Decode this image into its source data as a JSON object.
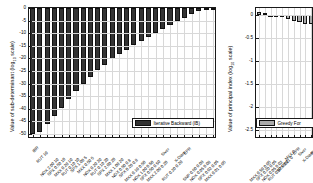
{
  "figure": {
    "background": "#ffffff",
    "axis_color": "#1a1a1a",
    "grid_color": "#d8d8d8"
  },
  "chart_data": [
    {
      "type": "bar",
      "panel": "left",
      "title": "",
      "xlabel": "",
      "ylabel": "Value of sub-determinant (log10 scale)",
      "ylabel_text": "Value of sub-determinant (log",
      "ylabel_sub": "10",
      "ylabel_tail": " scale)",
      "ylim": [
        -52,
        0
      ],
      "yticks": [
        0,
        -5,
        -10,
        -15,
        -20,
        -25,
        -30,
        -35,
        -40,
        -45,
        -50
      ],
      "ytick_labels": [
        "0",
        "-5",
        "-10",
        "-15",
        "-20",
        "-25",
        "-30",
        "-35",
        "-40",
        "-45",
        "-50"
      ],
      "grid": true,
      "bar_color": "#333333",
      "bar_edge_color": "#111111",
      "legend_position": "lower-right",
      "legend": [
        "Iterative Backward (IB)"
      ],
      "categories": [
        "IBR",
        "RUT 10",
        "NDX 2.00 10",
        "SPX 0.50 10",
        "MXX 0.20 10",
        "RUT 0.10 10",
        "SPX 1.00 5",
        "MXX 0.50 5",
        "NDX 0.20 20",
        "RUT 0.10 20",
        "SPX 2.00 20",
        "MXX 1.00 20",
        "NDX 0.50 0.8",
        "SPX 0.20 0.8",
        "MXX 0.10 0.50",
        "NDX 1.00 0.50",
        "SPX 0.50 0.50",
        "MXX 2.00 0.20",
        "Siver",
        "RUT 0.20 0.20",
        "X-Diam",
        "EPR",
        "SNP 0.50 0.08",
        "NDX 0.05 0.08",
        "SPX 0.02 0.05",
        "MXX 0.01 0.05"
      ],
      "values": [
        -50.2,
        -49.2,
        -46.1,
        -43.0,
        -39.8,
        -36.3,
        -33.0,
        -30.0,
        -27.2,
        -24.8,
        -22.6,
        -20.4,
        -18.4,
        -16.5,
        -14.8,
        -13.0,
        -11.4,
        -9.8,
        -8.2,
        -6.6,
        -5.2,
        -3.8,
        -2.4,
        -1.3,
        -0.7,
        -0.3
      ]
    },
    {
      "type": "bar",
      "panel": "right",
      "title": "",
      "xlabel": "",
      "ylabel": "Value of principal index (log10 scale)",
      "ylabel_text": "Value of principal index (log",
      "ylabel_sub": "10",
      "ylabel_tail": " scale)",
      "ylim": [
        -2.7,
        0.15
      ],
      "yticks": [
        0,
        -0.5,
        -1,
        -1.5,
        -2,
        -2.5
      ],
      "ytick_labels": [
        "0",
        "-0.5",
        "-1",
        "-1.5",
        "-2",
        "-2.5"
      ],
      "grid": true,
      "bar_color": "#aaaaaa",
      "bar_edge_color": "#111111",
      "legend_position": "lower-left",
      "legend": [
        "Greedy For"
      ],
      "categories": [
        "MXX 0.50 0.05",
        "SPX 0.20 0.05",
        "NDX 0.05 0.02",
        "RUT 0.02 0.02",
        "SPX 0.01 0",
        "MXX 0",
        "EPR",
        "Siver",
        "X-Diam",
        "RUT"
      ],
      "values": [
        0.06,
        0.04,
        -0.02,
        -0.03,
        -0.05,
        -0.09,
        -0.13,
        -0.16,
        -0.19,
        -0.2
      ]
    }
  ]
}
